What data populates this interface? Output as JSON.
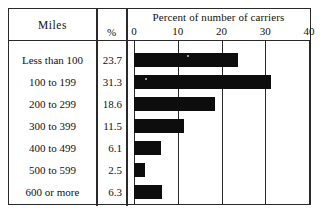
{
  "table": {
    "header_miles": "Miles",
    "header_percent": "%"
  },
  "chart_data": {
    "type": "bar",
    "orientation": "horizontal",
    "title": "Percent of number of carriers",
    "xlabel": "",
    "ylabel": "Miles",
    "categories": [
      "Less than 100",
      "100 to 199",
      "200 to 299",
      "300 to 399",
      "400 to 499",
      "500 to 599",
      "600 or more"
    ],
    "values": [
      23.7,
      31.3,
      18.6,
      11.5,
      6.1,
      2.5,
      6.3
    ],
    "value_labels": [
      "23.7",
      "31.3",
      "18.6",
      "11.5",
      "6.1",
      "2.5",
      "6.3"
    ],
    "xlim": [
      0,
      40
    ],
    "xticks": [
      0,
      10,
      20,
      30,
      40
    ],
    "xtick_labels": [
      "0",
      "10",
      "20",
      "30",
      "40"
    ],
    "grid": true,
    "legend": false,
    "bar_color": "#0d0d0d",
    "frame_color": "#2a2a2a",
    "background": "#ffffff"
  }
}
